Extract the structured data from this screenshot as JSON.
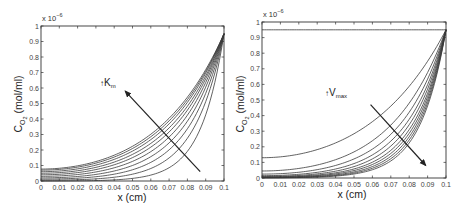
{
  "chart_data": [
    {
      "type": "line",
      "panel": "left",
      "title": "",
      "xlabel": "x (cm)",
      "ylabel": "C_O2 (mol/ml)",
      "y_multiplier": "x 10^-6",
      "xlim": [
        0,
        0.1
      ],
      "ylim": [
        0,
        1
      ],
      "x_ticks": [
        "0",
        "0.01",
        "0.02",
        "0.03",
        "0.04",
        "0.05",
        "0.06",
        "0.07",
        "0.08",
        "0.09",
        "0.1"
      ],
      "y_ticks": [
        "0",
        "0.1",
        "0.2",
        "0.3",
        "0.4",
        "0.5",
        "0.6",
        "0.7",
        "0.8",
        "0.9",
        "1"
      ],
      "grid": false,
      "annotation": {
        "text": "↑K_m",
        "arrow_from": [
          0.087,
          0.06
        ],
        "arrow_to": [
          0.046,
          0.58
        ]
      },
      "series": [
        {
          "name": "Km1",
          "x0_value": 0.0,
          "end_value": 0.95,
          "shape_exp": 80
        },
        {
          "name": "Km2",
          "x0_value": 0.005,
          "end_value": 0.95,
          "shape_exp": 62
        },
        {
          "name": "Km3",
          "x0_value": 0.012,
          "end_value": 0.95,
          "shape_exp": 52
        },
        {
          "name": "Km4",
          "x0_value": 0.02,
          "end_value": 0.95,
          "shape_exp": 45
        },
        {
          "name": "Km5",
          "x0_value": 0.03,
          "end_value": 0.95,
          "shape_exp": 40
        },
        {
          "name": "Km6",
          "x0_value": 0.04,
          "end_value": 0.95,
          "shape_exp": 36
        },
        {
          "name": "Km7",
          "x0_value": 0.05,
          "end_value": 0.95,
          "shape_exp": 33
        },
        {
          "name": "Km8",
          "x0_value": 0.06,
          "end_value": 0.95,
          "shape_exp": 30
        },
        {
          "name": "Km9",
          "x0_value": 0.07,
          "end_value": 0.95,
          "shape_exp": 28
        },
        {
          "name": "Km10",
          "x0_value": 0.077,
          "end_value": 0.95,
          "shape_exp": 26
        }
      ]
    },
    {
      "type": "line",
      "panel": "right",
      "title": "",
      "xlabel": "x (cm)",
      "ylabel": "C_O2 (mol/ml)",
      "y_multiplier": "x 10^-6",
      "xlim": [
        0,
        0.1
      ],
      "ylim": [
        0,
        1
      ],
      "x_ticks": [
        "0",
        "0.01",
        "0.02",
        "0.03",
        "0.04",
        "0.05",
        "0.06",
        "0.07",
        "0.08",
        "0.09",
        "0.1"
      ],
      "y_ticks": [
        "0",
        "0.1",
        "0.2",
        "0.3",
        "0.4",
        "0.5",
        "0.6",
        "0.7",
        "0.8",
        "0.9",
        "1"
      ],
      "grid": false,
      "annotation": {
        "text": "↑V_max",
        "arrow_from": [
          0.059,
          0.47
        ],
        "arrow_to": [
          0.089,
          0.08
        ]
      },
      "series": [
        {
          "name": "Vmax0",
          "x0_value": 0.95,
          "end_value": 0.95,
          "shape_exp": 0
        },
        {
          "name": "Vmax1",
          "x0_value": 0.13,
          "end_value": 0.95,
          "shape_exp": 22
        },
        {
          "name": "Vmax2",
          "x0_value": 0.045,
          "end_value": 0.95,
          "shape_exp": 33
        },
        {
          "name": "Vmax3",
          "x0_value": 0.025,
          "end_value": 0.95,
          "shape_exp": 40
        },
        {
          "name": "Vmax4",
          "x0_value": 0.015,
          "end_value": 0.95,
          "shape_exp": 46
        },
        {
          "name": "Vmax5",
          "x0_value": 0.01,
          "end_value": 0.95,
          "shape_exp": 51
        },
        {
          "name": "Vmax6",
          "x0_value": 0.007,
          "end_value": 0.95,
          "shape_exp": 56
        },
        {
          "name": "Vmax7",
          "x0_value": 0.005,
          "end_value": 0.95,
          "shape_exp": 60
        },
        {
          "name": "Vmax8",
          "x0_value": 0.003,
          "end_value": 0.95,
          "shape_exp": 64
        },
        {
          "name": "Vmax9",
          "x0_value": 0.002,
          "end_value": 0.95,
          "shape_exp": 68
        },
        {
          "name": "Vmax10",
          "x0_value": 0.001,
          "end_value": 0.95,
          "shape_exp": 72
        }
      ]
    }
  ],
  "panels": {
    "left": {
      "xlabel": "x (cm)",
      "ylabel_main": "C",
      "ylabel_sub": "O",
      "ylabel_subsub": "2",
      "ylabel_unit": " (mol/ml)",
      "multiplier_base": "x 10",
      "multiplier_exp": "−6",
      "annotation_arrow": "↑",
      "annotation_main": "K",
      "annotation_sub": "m"
    },
    "right": {
      "xlabel": "x (cm)",
      "ylabel_main": "C",
      "ylabel_sub": "O",
      "ylabel_subsub": "2",
      "ylabel_unit": " (mol/ml)",
      "multiplier_base": "x 10",
      "multiplier_exp": "−6",
      "annotation_arrow": "↑",
      "annotation_main": "V",
      "annotation_sub": "max"
    }
  },
  "colors": {
    "line": "#3a3a3a",
    "axis": "#333333",
    "arrow": "#222222"
  }
}
